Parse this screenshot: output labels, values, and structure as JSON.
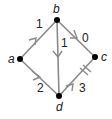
{
  "diagram": {
    "type": "directed-graph",
    "nodes": [
      {
        "id": "a",
        "label": "a"
      },
      {
        "id": "b",
        "label": "b"
      },
      {
        "id": "c",
        "label": "c"
      },
      {
        "id": "d",
        "label": "d"
      }
    ],
    "edges": [
      {
        "from": "a",
        "to": "b",
        "weight": "1"
      },
      {
        "from": "b",
        "to": "c",
        "weight": "0"
      },
      {
        "from": "b",
        "to": "d",
        "weight": "1"
      },
      {
        "from": "a",
        "to": "d",
        "weight": "2"
      },
      {
        "from": "d",
        "to": "c",
        "weight": "3",
        "marker": "double-tick"
      }
    ],
    "colors": {
      "edge": "#8a8a8a",
      "node": "#000000",
      "text": "#222222"
    }
  }
}
